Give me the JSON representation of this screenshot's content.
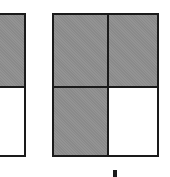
{
  "diagram": {
    "colors": {
      "shaded": "#8a8a8a",
      "unshaded": "#ffffff",
      "border": "#1a1a1a"
    },
    "figures": [
      {
        "id": "left-partial",
        "parts": 2,
        "shaded_parts": 1,
        "layout": "2 rows x 1 column (partially cropped)",
        "cells": [
          {
            "row": 0,
            "col": 0,
            "shaded": true
          },
          {
            "row": 1,
            "col": 0,
            "shaded": false
          }
        ]
      },
      {
        "id": "right-grid",
        "parts": 4,
        "shaded_parts": 3,
        "layout": "2 rows x 2 columns",
        "cells": [
          {
            "row": 0,
            "col": 0,
            "shaded": true
          },
          {
            "row": 0,
            "col": 1,
            "shaded": true
          },
          {
            "row": 1,
            "col": 0,
            "shaded": true
          },
          {
            "row": 1,
            "col": 1,
            "shaded": false
          }
        ]
      }
    ],
    "bottom_mark": "partial label glyph cropped at bottom edge"
  }
}
